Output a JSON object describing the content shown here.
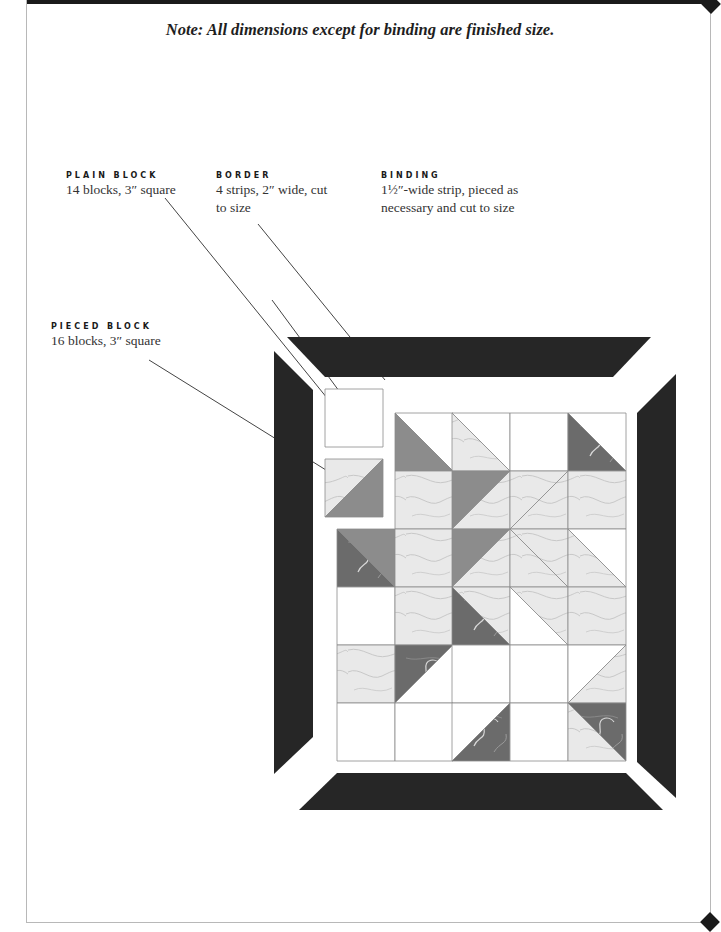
{
  "note": "Note: All dimensions except for binding are finished size.",
  "labels": {
    "plain_block": {
      "heading": "PLAIN BLOCK",
      "desc_lines": [
        "14 blocks, 3″ square"
      ]
    },
    "border": {
      "heading": "BORDER",
      "desc_lines": [
        "4 strips, 2″ wide, cut",
        "to size"
      ]
    },
    "binding": {
      "heading": "BINDING",
      "desc_lines": [
        "1½″-wide strip, pieced as",
        "necessary and cut to size"
      ]
    },
    "pieced_block": {
      "heading": "PIECED BLOCK",
      "desc_lines": [
        "16 blocks, 3″ square"
      ]
    }
  },
  "colors": {
    "border": "#262626",
    "dark_fabric": "#6b6b6b",
    "medium_fabric": "#8c8c8c",
    "light_fabric": "#e9e9e9",
    "plain": "#ffffff",
    "outline": "#8a8a8a"
  },
  "quilt": {
    "grid_cols": 5,
    "grid_rows": 6,
    "cells": [
      {
        "row": 0,
        "col": 1,
        "type": "hst",
        "split": "tl-br",
        "lower": "medium",
        "upper": "plain"
      },
      {
        "row": 0,
        "col": 2,
        "type": "hst",
        "split": "tl-br",
        "lower": "light",
        "upper": "plain"
      },
      {
        "row": 0,
        "col": 3,
        "type": "plain"
      },
      {
        "row": 0,
        "col": 4,
        "type": "hst",
        "split": "tl-br",
        "lower": "dark",
        "upper": "plain"
      },
      {
        "row": 1,
        "col": 1,
        "type": "solid",
        "fabric": "light"
      },
      {
        "row": 1,
        "col": 2,
        "type": "hst",
        "split": "tr-bl",
        "upper": "medium",
        "lower": "light"
      },
      {
        "row": 1,
        "col": 3,
        "type": "hst",
        "split": "tr-bl",
        "upper": "light",
        "lower": "light"
      },
      {
        "row": 1,
        "col": 4,
        "type": "solid",
        "fabric": "light"
      },
      {
        "row": 2,
        "col": 0,
        "type": "hst",
        "split": "tl-br",
        "lower": "dark",
        "upper": "medium"
      },
      {
        "row": 2,
        "col": 1,
        "type": "solid",
        "fabric": "light"
      },
      {
        "row": 2,
        "col": 2,
        "type": "hst",
        "split": "tr-bl",
        "upper": "medium",
        "lower": "light"
      },
      {
        "row": 2,
        "col": 3,
        "type": "hst",
        "split": "tl-br",
        "lower": "light",
        "upper": "light"
      },
      {
        "row": 2,
        "col": 4,
        "type": "hst",
        "split": "tl-br",
        "lower": "light",
        "upper": "plain"
      },
      {
        "row": 3,
        "col": 0,
        "type": "plain"
      },
      {
        "row": 3,
        "col": 1,
        "type": "solid",
        "fabric": "light"
      },
      {
        "row": 3,
        "col": 2,
        "type": "hst",
        "split": "tl-br",
        "lower": "dark",
        "upper": "light"
      },
      {
        "row": 3,
        "col": 3,
        "type": "hst",
        "split": "tl-br",
        "lower": "plain",
        "upper": "light"
      },
      {
        "row": 3,
        "col": 4,
        "type": "solid",
        "fabric": "light"
      },
      {
        "row": 4,
        "col": 0,
        "type": "solid",
        "fabric": "light"
      },
      {
        "row": 4,
        "col": 1,
        "type": "hst",
        "split": "tr-bl",
        "upper": "dark",
        "lower": "plain"
      },
      {
        "row": 4,
        "col": 2,
        "type": "plain"
      },
      {
        "row": 4,
        "col": 3,
        "type": "plain"
      },
      {
        "row": 4,
        "col": 4,
        "type": "hst",
        "split": "tr-bl",
        "upper": "plain",
        "lower": "light"
      },
      {
        "row": 5,
        "col": 0,
        "type": "plain"
      },
      {
        "row": 5,
        "col": 1,
        "type": "plain"
      },
      {
        "row": 5,
        "col": 2,
        "type": "hst",
        "split": "tr-bl",
        "upper": "plain",
        "lower": "dark"
      },
      {
        "row": 5,
        "col": 3,
        "type": "plain"
      },
      {
        "row": 5,
        "col": 4,
        "type": "hst",
        "split": "tl-br",
        "lower": "light",
        "upper": "dark"
      }
    ],
    "samples": [
      {
        "name": "plain-block-sample",
        "type": "plain"
      },
      {
        "name": "pieced-block-sample",
        "type": "hst",
        "split": "tr-bl",
        "upper": "light",
        "lower": "medium"
      }
    ]
  }
}
